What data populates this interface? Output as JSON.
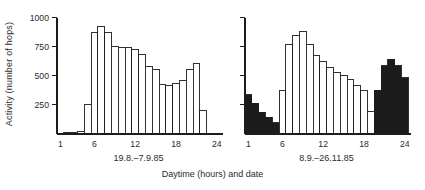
{
  "figure": {
    "ylabel": "Activity (number of hops)",
    "xlabel": "Daytime (hours) and date",
    "ink_color": "#1c1c1c",
    "text_color": "#2b2b2b",
    "bar_fill_white": "#ffffff",
    "background": "#ffffff"
  },
  "chart_data": [
    {
      "type": "bar",
      "title": "19.8.–7.9.85",
      "x_hours": [
        1,
        2,
        3,
        4,
        5,
        6,
        7,
        8,
        9,
        10,
        11,
        12,
        13,
        14,
        15,
        16,
        17,
        18,
        19,
        20,
        21,
        22,
        23,
        24
      ],
      "values": [
        0,
        15,
        15,
        20,
        250,
        875,
        925,
        870,
        750,
        745,
        740,
        725,
        685,
        580,
        555,
        425,
        420,
        435,
        460,
        555,
        605,
        205,
        0,
        0
      ],
      "filled": [
        0,
        0,
        0,
        0,
        0,
        0,
        0,
        0,
        0,
        0,
        0,
        0,
        0,
        0,
        0,
        0,
        0,
        0,
        0,
        0,
        0,
        0,
        0,
        0
      ],
      "xticks": [
        1,
        6,
        12,
        18,
        24
      ],
      "yticks": [
        250,
        500,
        750,
        1000
      ],
      "ylim": [
        0,
        1000
      ],
      "show_ytick_labels": true,
      "grid": false,
      "bar_style": "outline, filled=solid black"
    },
    {
      "type": "bar",
      "title": "8.9.–26.11.85",
      "x_hours": [
        1,
        2,
        3,
        4,
        5,
        6,
        7,
        8,
        9,
        10,
        11,
        12,
        13,
        14,
        15,
        16,
        17,
        18,
        19,
        20,
        21,
        22,
        23,
        24
      ],
      "values": [
        335,
        265,
        185,
        145,
        95,
        370,
        770,
        845,
        880,
        770,
        675,
        625,
        570,
        530,
        500,
        465,
        420,
        370,
        190,
        375,
        585,
        640,
        585,
        485
      ],
      "filled": [
        1,
        1,
        1,
        1,
        1,
        0,
        0,
        0,
        0,
        0,
        0,
        0,
        0,
        0,
        0,
        0,
        0,
        0,
        0,
        1,
        1,
        1,
        1,
        1
      ],
      "xticks": [
        1,
        6,
        12,
        18,
        24
      ],
      "yticks": [
        250,
        500,
        750,
        1000
      ],
      "ylim": [
        0,
        1000
      ],
      "show_ytick_labels": false,
      "grid": false,
      "bar_style": "outline, filled=solid black"
    }
  ]
}
